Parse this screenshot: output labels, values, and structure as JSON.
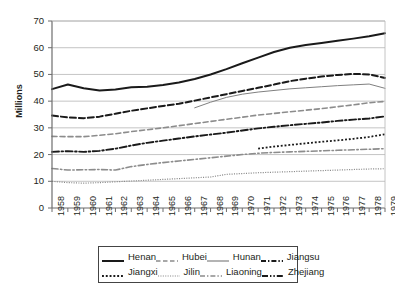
{
  "chart_data": {
    "type": "line",
    "title": "",
    "xlabel": "",
    "ylabel": "Millions",
    "ylim": [
      0,
      70
    ],
    "ytick_step": 10,
    "yticks": [
      0,
      10,
      20,
      30,
      40,
      50,
      60,
      70
    ],
    "grid": "horizontal",
    "legend_position": "bottom",
    "x": [
      1958,
      1959,
      1960,
      1961,
      1962,
      1963,
      1964,
      1965,
      1966,
      1967,
      1968,
      1969,
      1970,
      1971,
      1972,
      1973,
      1974,
      1975,
      1976,
      1977,
      1978,
      1979
    ],
    "categories": [
      "1958",
      "1959",
      "1960",
      "1961",
      "1962",
      "1963",
      "1964",
      "1965",
      "1966",
      "1967",
      "1968",
      "1969",
      "1970",
      "1971",
      "1972",
      "1973",
      "1974",
      "1975",
      "1976",
      "1977",
      "1978",
      "1979"
    ],
    "series": [
      {
        "name": "Henan",
        "style": "solid",
        "color": "#1a1a1a",
        "width": 2.0,
        "start_year": 1958,
        "values": [
          44.5,
          46.2,
          44.8,
          44.0,
          44.4,
          45.2,
          45.4,
          46.0,
          47.0,
          48.3,
          50.0,
          52.0,
          54.2,
          56.3,
          58.4,
          60.0,
          61.0,
          61.8,
          62.6,
          63.4,
          64.3,
          65.4
        ]
      },
      {
        "name": "Hubei",
        "style": "dashed",
        "color": "#1a1a1a",
        "width": 2.0,
        "start_year": 1958,
        "values": [
          34.6,
          33.9,
          33.6,
          34.2,
          35.3,
          36.4,
          37.3,
          38.2,
          39.0,
          40.2,
          41.4,
          42.6,
          43.8,
          45.0,
          46.2,
          47.5,
          48.4,
          49.2,
          49.8,
          50.2,
          50.0,
          48.7
        ]
      },
      {
        "name": "Hunan",
        "style": "thin-solid",
        "color": "#808080",
        "width": 1.0,
        "start_year": 1967,
        "values": [
          null,
          null,
          null,
          null,
          null,
          null,
          null,
          null,
          null,
          37.5,
          39.6,
          41.4,
          42.6,
          43.4,
          44.0,
          44.6,
          45.0,
          45.4,
          45.8,
          46.1,
          46.4,
          44.8
        ]
      },
      {
        "name": "Jiangsu",
        "style": "dash-dot",
        "color": "#1a1a1a",
        "width": 1.9,
        "start_year": 1958,
        "values": [
          21.0,
          21.3,
          21.0,
          21.4,
          22.2,
          23.4,
          24.4,
          25.2,
          26.0,
          26.8,
          27.5,
          28.2,
          29.0,
          29.8,
          30.4,
          31.0,
          31.5,
          32.0,
          32.6,
          33.1,
          33.5,
          34.3
        ]
      },
      {
        "name": "Jiangxi",
        "style": "bold-dotted",
        "color": "#1a1a1a",
        "width": 1.8,
        "start_year": 1971,
        "values": [
          null,
          null,
          null,
          null,
          null,
          null,
          null,
          null,
          null,
          null,
          null,
          null,
          null,
          22.2,
          23.0,
          23.6,
          24.2,
          24.8,
          25.3,
          25.9,
          26.6,
          27.6
        ]
      },
      {
        "name": "Jilin",
        "style": "fine-dotted",
        "color": "#8c8c8c",
        "width": 1.2,
        "start_year": 1958,
        "values": [
          10.0,
          9.5,
          9.3,
          9.5,
          9.8,
          10.1,
          10.4,
          10.7,
          11.0,
          11.3,
          11.6,
          12.6,
          12.9,
          13.2,
          13.4,
          13.6,
          13.8,
          14.0,
          14.2,
          14.4,
          14.6,
          14.7
        ]
      },
      {
        "name": "Liaoning",
        "style": "dashed",
        "color": "#8c8c8c",
        "width": 1.6,
        "start_year": 1958,
        "values": [
          26.8,
          26.7,
          26.7,
          27.2,
          27.8,
          28.6,
          29.3,
          30.0,
          30.8,
          31.6,
          32.4,
          33.2,
          34.0,
          34.8,
          35.4,
          36.0,
          36.6,
          37.2,
          37.9,
          38.6,
          39.4,
          39.9
        ]
      },
      {
        "name": "Zhejiang",
        "style": "dash-dot",
        "color": "#8c8c8c",
        "width": 1.6,
        "start_year": 1958,
        "values": [
          14.8,
          14.2,
          14.3,
          14.4,
          14.2,
          15.5,
          16.3,
          17.0,
          17.6,
          18.2,
          18.8,
          19.4,
          20.0,
          20.5,
          20.8,
          21.0,
          21.2,
          21.4,
          21.6,
          21.8,
          22.0,
          22.2
        ]
      }
    ]
  },
  "legend": {
    "rows": [
      [
        {
          "name": "Henan",
          "swatch": "solid-black-thick"
        },
        {
          "name": "Hubei",
          "swatch": "dashed-gray"
        },
        {
          "name": "Hunan",
          "swatch": "solid-gray-thin"
        },
        {
          "name": "Jiangsu",
          "swatch": "dash-dot-black"
        }
      ],
      [
        {
          "name": "Jiangxi",
          "swatch": "bold-dotted-black"
        },
        {
          "name": "Jilin",
          "swatch": "fine-dotted-gray"
        },
        {
          "name": "Liaoning",
          "swatch": "dash-dot-gray"
        },
        {
          "name": "Zhejiang",
          "swatch": "dash-dot-dot-black"
        }
      ]
    ]
  },
  "colors": {
    "black": "#1a1a1a",
    "gray": "#8c8c8c",
    "gridline": "#b5b5b5",
    "axis": "#6d6d6d",
    "text": "#231f20"
  }
}
